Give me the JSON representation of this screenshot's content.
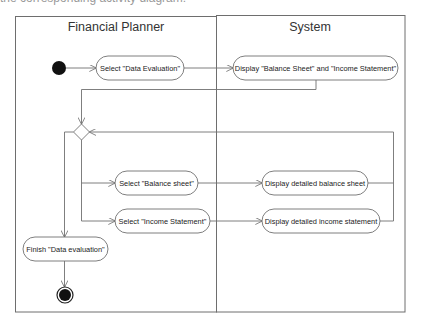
{
  "caption": "the corresponding activity diagram:",
  "diagram": {
    "type": "uml-activity-diagram",
    "lanes": [
      {
        "id": "planner",
        "title": "Financial Planner"
      },
      {
        "id": "system",
        "title": "System"
      }
    ],
    "nodes": {
      "start": {
        "kind": "initial"
      },
      "select_data_evaluation": {
        "kind": "action",
        "lane": "planner",
        "label": "Select \"Data Evaluation\""
      },
      "display_overview": {
        "kind": "action",
        "lane": "system",
        "label": "Display \"Balance Sheet\" and \"Income Statement\""
      },
      "decision": {
        "kind": "decision"
      },
      "select_balance_sheet": {
        "kind": "action",
        "lane": "planner",
        "label": "Select \"Balance sheet\""
      },
      "select_income_statement": {
        "kind": "action",
        "lane": "planner",
        "label": "Select \"Income Statement\""
      },
      "display_balance_sheet": {
        "kind": "action",
        "lane": "system",
        "label": "Display detailed balance sheet"
      },
      "display_income_statement": {
        "kind": "action",
        "lane": "system",
        "label": "Display detailed income statement"
      },
      "finish_data_evaluation": {
        "kind": "action",
        "lane": "planner",
        "label": "Finish \"Data evaluation\""
      },
      "end": {
        "kind": "final"
      }
    },
    "edges": [
      [
        "start",
        "select_data_evaluation"
      ],
      [
        "select_data_evaluation",
        "display_overview"
      ],
      [
        "display_overview",
        "decision"
      ],
      [
        "decision",
        "select_balance_sheet"
      ],
      [
        "decision",
        "select_income_statement"
      ],
      [
        "decision",
        "finish_data_evaluation"
      ],
      [
        "select_balance_sheet",
        "display_balance_sheet"
      ],
      [
        "select_income_statement",
        "display_income_statement"
      ],
      [
        "display_balance_sheet",
        "decision"
      ],
      [
        "display_income_statement",
        "decision"
      ],
      [
        "finish_data_evaluation",
        "end"
      ]
    ]
  }
}
